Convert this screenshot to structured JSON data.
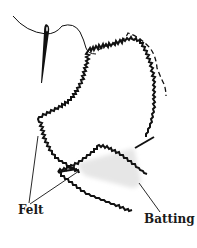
{
  "diagram": {
    "labels": {
      "felt": "Felt",
      "batting": "Batting"
    },
    "colors": {
      "outline": "#111111",
      "batting_fill": "#e6e6e6",
      "background": "#ffffff"
    },
    "elements": [
      {
        "name": "needle",
        "type": "icon"
      },
      {
        "name": "thread",
        "type": "line"
      },
      {
        "name": "top-felt-piece",
        "type": "pinked-outline"
      },
      {
        "name": "bottom-felt-piece",
        "type": "pinked-outline"
      },
      {
        "name": "stitch-line",
        "type": "dashed-line"
      },
      {
        "name": "batting",
        "type": "filled-shape"
      }
    ]
  }
}
